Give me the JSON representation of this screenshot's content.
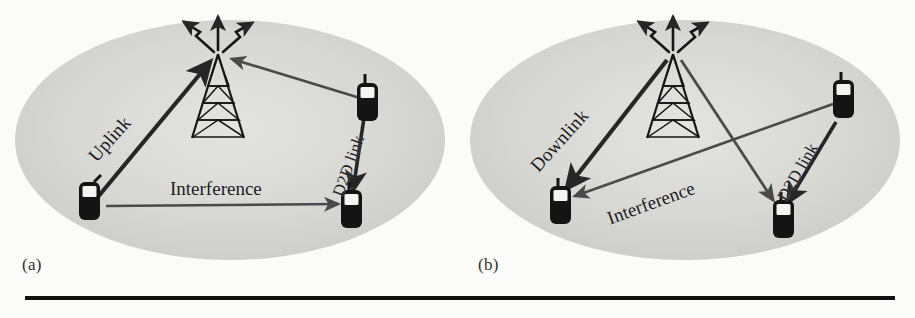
{
  "figure": {
    "background_color": "#fbfbf9",
    "cell_fill_color": "#d6d6d4",
    "cell_edge_color": "#bfbfbc",
    "ink_color": "#1a1a1a",
    "arrow_color": "#3d3d3d",
    "rule_color": "#111111",
    "width": 915,
    "height": 318
  },
  "panels": [
    {
      "id": "a",
      "caption": "(a)",
      "scenario": "Uplink reuse: D2D pair reuses cellular uplink resource, causing interference at the D2D receiver.",
      "cell": {
        "cx": 230,
        "cy": 140,
        "rx": 215,
        "ry": 120
      },
      "nodes": [
        {
          "name": "base-station-tower",
          "type": "tower",
          "x": 218,
          "y": 52
        },
        {
          "name": "cellular-user-phone",
          "type": "phone",
          "x": 88,
          "y": 205
        },
        {
          "name": "d2d-transmitter-phone",
          "type": "phone",
          "x": 368,
          "y": 105
        },
        {
          "name": "d2d-receiver-phone",
          "type": "phone",
          "x": 352,
          "y": 207
        }
      ],
      "links": [
        {
          "name": "uplink-arrow",
          "label": "Uplink",
          "from": "cellular-user-phone",
          "to": "base-station-tower",
          "style": "solid-thick",
          "direction": "to-tower"
        },
        {
          "name": "interference-arrow",
          "label": "Interference",
          "from": "d2d-transmitter-phone",
          "to": "base-station-tower",
          "style": "solid-thin",
          "direction": "to-tower",
          "unlabeled_segment": true
        },
        {
          "name": "interference-horizontal-arrow",
          "label": "Interference",
          "from": "cellular-user-phone",
          "to": "d2d-receiver-phone",
          "style": "solid-thin",
          "direction": "to-right"
        },
        {
          "name": "d2d-link-arrow",
          "label": "D2D link",
          "from": "d2d-transmitter-phone",
          "to": "d2d-receiver-phone",
          "style": "solid-thick",
          "direction": "downward"
        }
      ],
      "labels": [
        {
          "name": "uplink-label",
          "text": "Uplink",
          "rotation": -48
        },
        {
          "name": "interference-label",
          "text": "Interference",
          "rotation": 0
        },
        {
          "name": "d2d-link-label",
          "text": "D2D link",
          "rotation": -70
        }
      ]
    },
    {
      "id": "b",
      "caption": "(b)",
      "scenario": "Downlink reuse: D2D pair reuses cellular downlink resource, base station interferes with the D2D receiver.",
      "cell": {
        "cx": 685,
        "cy": 140,
        "rx": 215,
        "ry": 120
      },
      "nodes": [
        {
          "name": "base-station-tower",
          "type": "tower",
          "x": 673,
          "y": 52
        },
        {
          "name": "cellular-user-phone",
          "type": "phone",
          "x": 560,
          "y": 205
        },
        {
          "name": "d2d-transmitter-phone",
          "type": "phone",
          "x": 840,
          "y": 100
        },
        {
          "name": "d2d-receiver-phone",
          "type": "phone",
          "x": 778,
          "y": 218
        }
      ],
      "links": [
        {
          "name": "downlink-arrow",
          "label": "Downlink",
          "from": "base-station-tower",
          "to": "cellular-user-phone",
          "style": "solid-thick",
          "direction": "to-phone"
        },
        {
          "name": "interference-arrow",
          "label": "Interference",
          "from": "base-station-tower",
          "to": "d2d-receiver-phone",
          "style": "solid-thin",
          "direction": "to-phone"
        },
        {
          "name": "interference-horizontal-arrow",
          "label": "Interference",
          "from": "d2d-transmitter-phone",
          "to": "cellular-user-phone",
          "style": "solid-thin",
          "direction": "to-left"
        },
        {
          "name": "d2d-link-arrow",
          "label": "D2D link",
          "from": "d2d-transmitter-phone",
          "to": "d2d-receiver-phone",
          "style": "solid-thick",
          "direction": "downward"
        }
      ],
      "labels": [
        {
          "name": "downlink-label",
          "text": "Downlink",
          "rotation": -48
        },
        {
          "name": "interference-label",
          "text": "Interference",
          "rotation": -20
        },
        {
          "name": "d2d-link-label",
          "text": "D2D link",
          "rotation": -60
        }
      ]
    }
  ],
  "bottom_rule": {
    "name": "horizontal-rule",
    "visible": true
  }
}
